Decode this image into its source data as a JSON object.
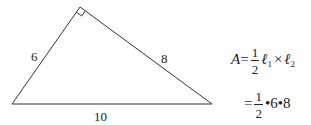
{
  "diagram": {
    "type": "right-triangle",
    "vertices": {
      "left": [
        12,
        104
      ],
      "top": [
        80,
        7
      ],
      "right": [
        212,
        104
      ]
    },
    "right_angle_at": "top",
    "side_labels": {
      "left_leg": "6",
      "right_leg": "8",
      "hypotenuse": "10"
    },
    "stroke_color": "#333333"
  },
  "formula": {
    "line1": {
      "lhs": "A",
      "eq": "=",
      "num": "1",
      "den": "2",
      "term1": "ℓ",
      "sub1": "1",
      "times": "×",
      "term2": "ℓ",
      "sub2": "2"
    },
    "line2": {
      "eq": "=",
      "num": "1",
      "den": "2",
      "rest": "•6•8"
    }
  }
}
